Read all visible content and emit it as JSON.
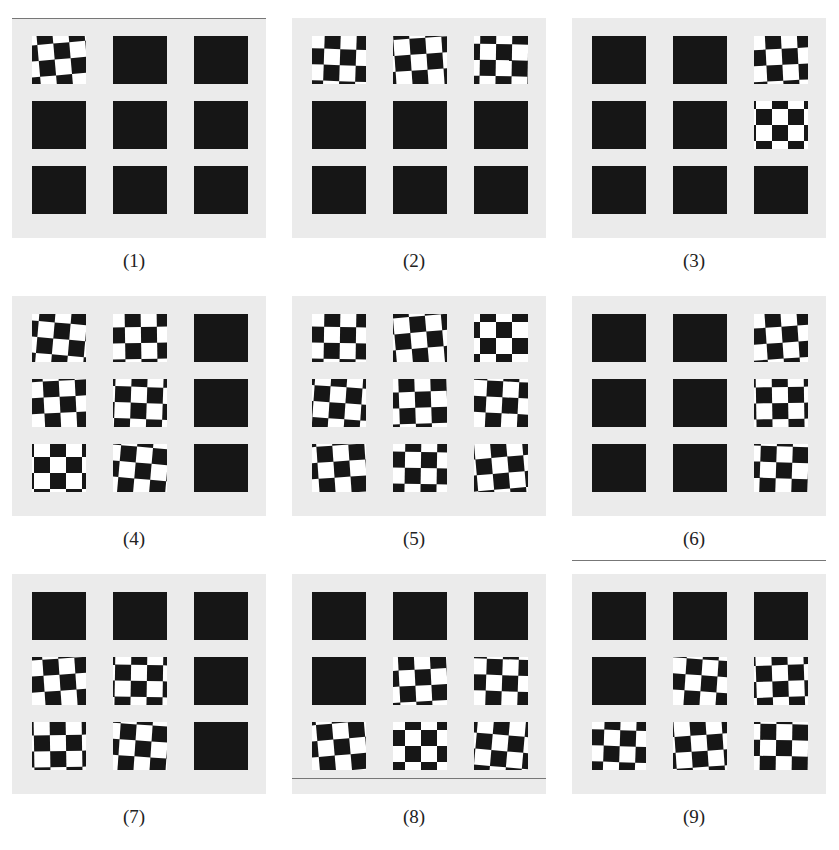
{
  "figure": {
    "panels": [
      {
        "label": "(1)",
        "x": 0,
        "y": 0,
        "active": [
          [
            0,
            0
          ]
        ]
      },
      {
        "label": "(2)",
        "x": 280,
        "y": 0,
        "active": [
          [
            0,
            0
          ],
          [
            0,
            1
          ],
          [
            0,
            2
          ]
        ]
      },
      {
        "label": "(3)",
        "x": 560,
        "y": 0,
        "active": [
          [
            0,
            2
          ],
          [
            1,
            2
          ]
        ]
      },
      {
        "label": "(4)",
        "x": 0,
        "y": 278,
        "active": [
          [
            0,
            0
          ],
          [
            0,
            1
          ],
          [
            1,
            0
          ],
          [
            1,
            1
          ],
          [
            2,
            0
          ],
          [
            2,
            1
          ]
        ]
      },
      {
        "label": "(5)",
        "x": 280,
        "y": 278,
        "active": [
          [
            0,
            0
          ],
          [
            0,
            1
          ],
          [
            0,
            2
          ],
          [
            1,
            0
          ],
          [
            1,
            1
          ],
          [
            1,
            2
          ],
          [
            2,
            0
          ],
          [
            2,
            1
          ],
          [
            2,
            2
          ]
        ]
      },
      {
        "label": "(6)",
        "x": 560,
        "y": 278,
        "active": [
          [
            0,
            2
          ],
          [
            1,
            2
          ],
          [
            2,
            2
          ]
        ]
      },
      {
        "label": "(7)",
        "x": 0,
        "y": 556,
        "active": [
          [
            1,
            0
          ],
          [
            1,
            1
          ],
          [
            2,
            0
          ],
          [
            2,
            1
          ]
        ]
      },
      {
        "label": "(8)",
        "x": 280,
        "y": 556,
        "active": [
          [
            1,
            1
          ],
          [
            1,
            2
          ],
          [
            2,
            0
          ],
          [
            2,
            1
          ],
          [
            2,
            2
          ]
        ]
      },
      {
        "label": "(9)",
        "x": 560,
        "y": 556,
        "active": [
          [
            1,
            1
          ],
          [
            1,
            2
          ],
          [
            2,
            0
          ],
          [
            2,
            1
          ],
          [
            2,
            2
          ]
        ]
      }
    ],
    "colors": {
      "background": "#ffffff",
      "plate": "#ebebeb",
      "square": "#161616",
      "checker_light": "#ffffff"
    }
  }
}
